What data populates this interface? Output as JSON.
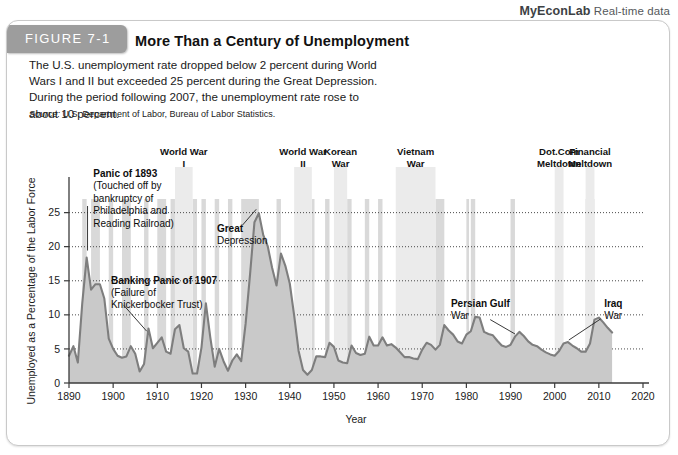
{
  "header": {
    "brand": "MyEconLab",
    "tagline": "Real-time data"
  },
  "figure": {
    "tab_label": "FIGURE 7-1",
    "title": "More Than a Century of Unemployment",
    "description": "The U.S. unemployment rate dropped below 2 percent during World Wars I and II but exceeded 25 percent during the Great Depression. During the period following 2007, the unemployment rate rose to about 10 percent.",
    "source_label": "Source:",
    "source_text": " U.S. Department of Labor, Bureau of Labor Statistics."
  },
  "chart_data": {
    "type": "area",
    "title": "More Than a Century of Unemployment",
    "xlabel": "Year",
    "ylabel": "Unemployed as a Percentage of the Labor Force",
    "xlim": [
      1890,
      2020
    ],
    "ylim": [
      0,
      27
    ],
    "xticks": [
      1890,
      1900,
      1910,
      1920,
      1930,
      1940,
      1950,
      1960,
      1970,
      1980,
      1990,
      2000,
      2010,
      2020
    ],
    "yticks": [
      0,
      5,
      10,
      15,
      20,
      25
    ],
    "grid": "horizontal-dotted",
    "legend": "none",
    "series_name": "U.S. unemployment rate",
    "x": [
      1890,
      1891,
      1892,
      1893,
      1894,
      1895,
      1896,
      1897,
      1898,
      1899,
      1900,
      1901,
      1902,
      1903,
      1904,
      1905,
      1906,
      1907,
      1908,
      1909,
      1910,
      1911,
      1912,
      1913,
      1914,
      1915,
      1916,
      1917,
      1918,
      1919,
      1920,
      1921,
      1922,
      1923,
      1924,
      1925,
      1926,
      1927,
      1928,
      1929,
      1930,
      1931,
      1932,
      1933,
      1934,
      1935,
      1936,
      1937,
      1938,
      1939,
      1940,
      1941,
      1942,
      1943,
      1944,
      1945,
      1946,
      1947,
      1948,
      1949,
      1950,
      1951,
      1952,
      1953,
      1954,
      1955,
      1956,
      1957,
      1958,
      1959,
      1960,
      1961,
      1962,
      1963,
      1964,
      1965,
      1966,
      1967,
      1968,
      1969,
      1970,
      1971,
      1972,
      1973,
      1974,
      1975,
      1976,
      1977,
      1978,
      1979,
      1980,
      1981,
      1982,
      1983,
      1984,
      1985,
      1986,
      1987,
      1988,
      1989,
      1990,
      1991,
      1992,
      1993,
      1994,
      1995,
      1996,
      1997,
      1998,
      1999,
      2000,
      2001,
      2002,
      2003,
      2004,
      2005,
      2006,
      2007,
      2008,
      2009,
      2010,
      2011,
      2012,
      2013
    ],
    "values": [
      4.0,
      5.4,
      3.0,
      11.7,
      18.4,
      13.7,
      14.5,
      14.5,
      12.4,
      6.5,
      5.0,
      4.0,
      3.7,
      3.9,
      5.4,
      4.3,
      1.7,
      2.8,
      8.0,
      5.1,
      5.9,
      6.7,
      4.6,
      4.3,
      7.9,
      8.5,
      5.1,
      4.6,
      1.4,
      1.4,
      5.2,
      11.7,
      6.7,
      2.4,
      5.0,
      3.2,
      1.8,
      3.3,
      4.2,
      3.2,
      8.7,
      15.9,
      23.6,
      24.9,
      21.7,
      20.1,
      16.9,
      14.3,
      19.0,
      17.2,
      14.6,
      9.9,
      4.7,
      1.9,
      1.2,
      1.9,
      3.9,
      3.9,
      3.8,
      5.9,
      5.3,
      3.3,
      3.0,
      2.9,
      5.5,
      4.4,
      4.1,
      4.3,
      6.8,
      5.5,
      5.5,
      6.7,
      5.5,
      5.7,
      5.2,
      4.5,
      3.8,
      3.8,
      3.6,
      3.5,
      4.9,
      5.9,
      5.6,
      4.9,
      5.6,
      8.5,
      7.7,
      7.1,
      6.1,
      5.8,
      7.1,
      7.6,
      9.7,
      9.6,
      7.5,
      7.2,
      7.0,
      6.2,
      5.5,
      5.3,
      5.6,
      6.8,
      7.5,
      6.9,
      6.1,
      5.6,
      5.4,
      4.9,
      4.5,
      4.2,
      4.0,
      4.7,
      5.8,
      6.0,
      5.5,
      5.1,
      4.6,
      4.6,
      5.8,
      9.3,
      9.6,
      8.9,
      8.1,
      7.4
    ],
    "annotations": [
      {
        "id": "panic-1893",
        "bold_text": "Panic of 1893",
        "body_text": "(Touched off by bankruptcy of Philadelphia and Reading Railroad)",
        "points_to_year": 1894
      },
      {
        "id": "banking-panic-1907",
        "bold_text": "Banking Panic of 1907",
        "body_text": "(Failure of Knickerbocker Trust)",
        "points_to_year": 1908
      },
      {
        "id": "great-depression",
        "bold_text": "Great Depression",
        "body_text": "",
        "points_to_year": 1933
      },
      {
        "id": "persian-gulf-war",
        "bold_text": "Persian Gulf War",
        "body_text": "",
        "points_to_year": 1991
      },
      {
        "id": "iraq-war",
        "bold_text": "Iraq War",
        "body_text": "",
        "points_to_year": 2003
      }
    ],
    "shaded_bands": [
      {
        "id": "world-war-i",
        "label": "World War I",
        "start": 1914,
        "end": 1918
      },
      {
        "id": "world-war-ii",
        "label": "World War II",
        "start": 1941,
        "end": 1945
      },
      {
        "id": "korean-war",
        "label": "Korean War",
        "start": 1950,
        "end": 1953
      },
      {
        "id": "vietnam-war",
        "label": "Vietnam War",
        "start": 1964,
        "end": 1973
      },
      {
        "id": "dot-com-meltdown",
        "label": "Dot.Com Meltdown",
        "start": 2000,
        "end": 2002
      },
      {
        "id": "financial-meltdown",
        "label": "Financial Meltdown",
        "start": 2007,
        "end": 2009
      }
    ],
    "recession_bands": [
      {
        "start": 1893,
        "end": 1894
      },
      {
        "start": 1895,
        "end": 1897
      },
      {
        "start": 1899,
        "end": 1900
      },
      {
        "start": 1902,
        "end": 1904
      },
      {
        "start": 1907,
        "end": 1908
      },
      {
        "start": 1910,
        "end": 1912
      },
      {
        "start": 1913,
        "end": 1914
      },
      {
        "start": 1918,
        "end": 1919
      },
      {
        "start": 1920,
        "end": 1921
      },
      {
        "start": 1923,
        "end": 1924
      },
      {
        "start": 1926,
        "end": 1927
      },
      {
        "start": 1929,
        "end": 1933
      },
      {
        "start": 1937,
        "end": 1938
      },
      {
        "start": 1945,
        "end": 1945
      },
      {
        "start": 1948,
        "end": 1949
      },
      {
        "start": 1953,
        "end": 1954
      },
      {
        "start": 1957,
        "end": 1958
      },
      {
        "start": 1960,
        "end": 1961
      },
      {
        "start": 1969,
        "end": 1970
      },
      {
        "start": 1973,
        "end": 1975
      },
      {
        "start": 1980,
        "end": 1980
      },
      {
        "start": 1981,
        "end": 1982
      },
      {
        "start": 1990,
        "end": 1991
      },
      {
        "start": 2001,
        "end": 2001
      },
      {
        "start": 2007,
        "end": 2009
      }
    ],
    "colors": {
      "series_fill": "#c9c9c9",
      "series_line": "#7e7e7e",
      "band": "#d9d9d9",
      "band_top": "#ebebeb",
      "axis": "#3b3b3b"
    }
  }
}
